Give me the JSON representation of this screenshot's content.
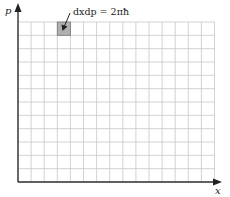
{
  "diagram": {
    "axes": {
      "x_label": "x",
      "y_label": "p"
    },
    "grid": {
      "columns": 15,
      "rows": 12,
      "line_color": "#c8c8c8",
      "axis_color": "#333333"
    },
    "highlight_cell": {
      "column": 3,
      "row": 0,
      "fill": "#b0b0b0"
    },
    "annotation": {
      "text": "dxdp = 2πħ"
    }
  }
}
